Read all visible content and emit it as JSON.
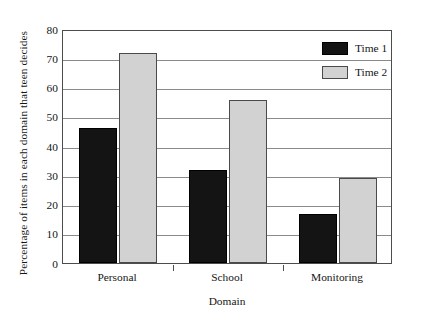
{
  "chart_data": {
    "type": "bar",
    "title": "",
    "xlabel": "Domain",
    "ylabel": "Percentage of items in each domain that teen decides",
    "categories": [
      "Personal",
      "School",
      "Monitoring"
    ],
    "series": [
      {
        "name": "Time 1",
        "color": "#141414",
        "values": [
          46,
          31.5,
          16.5
        ]
      },
      {
        "name": "Time 2",
        "color": "#d2d2d2",
        "values": [
          71.5,
          55.5,
          29
        ]
      }
    ],
    "ylim": [
      0,
      80
    ],
    "yticks": [
      0,
      10,
      20,
      30,
      40,
      50,
      60,
      70,
      80
    ],
    "ytick_labels": [
      "0",
      "10",
      "20",
      "30",
      "40",
      "50",
      "60",
      "70",
      "80"
    ],
    "grid": "horizontal",
    "legend_position": "top-right",
    "legend": [
      {
        "label": "Time 1",
        "color": "#141414"
      },
      {
        "label": "Time 2",
        "color": "#d2d2d2"
      }
    ]
  }
}
